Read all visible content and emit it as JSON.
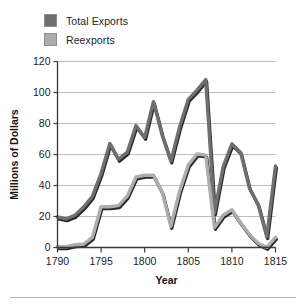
{
  "chart_data": {
    "type": "line",
    "title": "",
    "xlabel": "Year",
    "ylabel": "Millions of Dollars",
    "xlim": [
      1790,
      1815
    ],
    "ylim": [
      0,
      120
    ],
    "grid": true,
    "legend_position": "top-left-outside",
    "xticks": [
      1790,
      1795,
      1800,
      1805,
      1810,
      1815
    ],
    "yticks": [
      0,
      20,
      40,
      60,
      80,
      100,
      120
    ],
    "x": [
      1790,
      1791,
      1792,
      1793,
      1794,
      1795,
      1796,
      1797,
      1798,
      1799,
      1800,
      1801,
      1802,
      1803,
      1804,
      1805,
      1806,
      1807,
      1808,
      1809,
      1810,
      1811,
      1812,
      1813,
      1814,
      1815
    ],
    "series": [
      {
        "name": "Total Exports",
        "color": "#6f6f6f",
        "values": [
          19.7,
          18.5,
          20.8,
          26.1,
          33.0,
          47.9,
          67.1,
          56.9,
          61.5,
          78.7,
          71.0,
          94.1,
          72.5,
          55.8,
          77.7,
          95.6,
          101.5,
          108.3,
          22.4,
          52.2,
          66.8,
          61.3,
          38.5,
          27.9,
          6.9,
          52.6
        ]
      },
      {
        "name": "Reexports",
        "color": "#adadad",
        "values": [
          0.5,
          0.5,
          1.8,
          2.1,
          6.5,
          26.3,
          26.3,
          27.0,
          33.1,
          45.5,
          46.6,
          46.6,
          35.8,
          13.6,
          36.2,
          53.2,
          60.3,
          59.6,
          12.9,
          20.8,
          24.4,
          16.0,
          8.5,
          2.8,
          0.1,
          6.6
        ]
      }
    ]
  },
  "legend": {
    "items": [
      {
        "label": "Total Exports",
        "color": "#6f6f6f"
      },
      {
        "label": "Reexports",
        "color": "#adadad"
      }
    ]
  },
  "axes": {
    "y_title": "Millions of Dollars",
    "x_title": "Year",
    "y_tick_labels": [
      "0",
      "20",
      "40",
      "60",
      "80",
      "100",
      "120"
    ],
    "x_tick_labels": [
      "1790",
      "1795",
      "1800",
      "1805",
      "1810",
      "1815"
    ]
  },
  "colors": {
    "total_exports": "#6f6f6f",
    "reexports": "#adadad",
    "line_shadow": "#1c1c1c",
    "grid": "#bdbdbd",
    "axis": "#3a3a3a",
    "background": "#ffffff"
  }
}
